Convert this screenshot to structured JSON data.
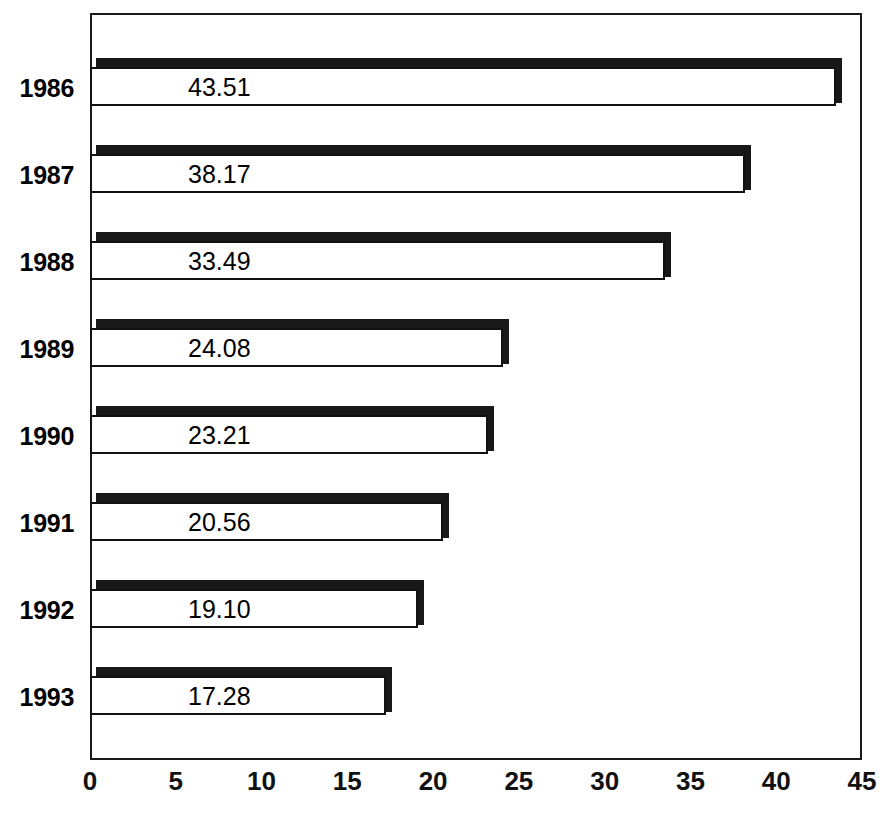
{
  "chart_data": {
    "type": "bar",
    "orientation": "horizontal",
    "title": "",
    "xlabel": "",
    "ylabel": "",
    "categories": [
      "1986",
      "1987",
      "1988",
      "1989",
      "1990",
      "1991",
      "1992",
      "1993"
    ],
    "values": [
      43.51,
      38.17,
      33.49,
      24.08,
      23.21,
      20.56,
      19.1,
      17.28
    ],
    "value_labels": [
      "43.51",
      "38.17",
      "33.49",
      "24.08",
      "23.21",
      "20.56",
      "19.10",
      "17.28"
    ],
    "xlim": [
      0,
      45
    ],
    "xticks": [
      0,
      5,
      10,
      15,
      20,
      25,
      30,
      35,
      40,
      45
    ],
    "xtick_labels": [
      "0",
      "5",
      "10",
      "15",
      "20",
      "25",
      "30",
      "35",
      "40",
      "45"
    ],
    "grid": false,
    "legend": false,
    "bar_style": "3d-outlined",
    "bar_fill_color": "#ffffff",
    "bar_edge_color": "#111111",
    "bar_shadow_color": "#181818",
    "frame_color": "#1a1a1a",
    "background_color": "#ffffff",
    "text_color": "#000000"
  },
  "axis": {
    "x_min_label": "0",
    "x_max_label": "45"
  }
}
